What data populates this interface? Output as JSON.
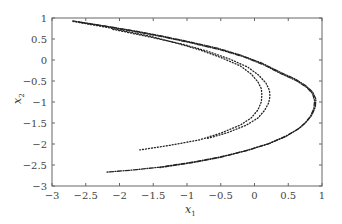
{
  "chart_data": {
    "type": "scatter",
    "title": "",
    "xlabel": "x1",
    "ylabel": "x2",
    "xlim": [
      -3,
      1
    ],
    "ylim": [
      -3,
      1
    ],
    "grid": false,
    "legend": null,
    "xticks": [
      -3,
      -2.5,
      -2,
      -1.5,
      -1,
      -0.5,
      0,
      0.5,
      1
    ],
    "xtick_labels": [
      "−3",
      "−2.5",
      "−2",
      "−1.5",
      "−1",
      "−0.5",
      "0",
      "0.5",
      "1"
    ],
    "yticks": [
      1,
      0.5,
      0,
      -0.5,
      -1,
      -1.5,
      -2,
      -2.5,
      -3
    ],
    "ytick_labels": [
      "1",
      "0.5",
      "0",
      "−0.5",
      "−1",
      "−1.5",
      "−2",
      "−2.5",
      "−3"
    ],
    "series": [
      {
        "name": "outer trajectory A",
        "style": "dash-dot",
        "x": [
          -2.69,
          -2.3,
          -1.84,
          -1.4,
          -0.96,
          -0.55,
          -0.21,
          0.1,
          0.38,
          0.6,
          0.75,
          0.86,
          0.91,
          0.9,
          0.85,
          0.77,
          0.67,
          0.48,
          0.23,
          -0.1,
          -0.51,
          -0.95,
          -1.4,
          -1.8,
          -2.19
        ],
        "y": [
          0.93,
          0.83,
          0.71,
          0.58,
          0.43,
          0.28,
          0.12,
          -0.07,
          -0.29,
          -0.45,
          -0.6,
          -0.76,
          -0.93,
          -1.12,
          -1.31,
          -1.47,
          -1.62,
          -1.8,
          -1.98,
          -2.15,
          -2.31,
          -2.44,
          -2.55,
          -2.62,
          -2.67
        ]
      },
      {
        "name": "outer trajectory B",
        "style": "dash-dot",
        "x": [
          -2.6,
          -2.2,
          -1.78,
          -1.35,
          -0.92,
          -0.5,
          -0.17,
          0.13,
          0.4,
          0.62,
          0.77,
          0.86,
          0.89,
          0.88,
          0.83,
          0.75,
          0.64,
          0.45,
          0.2,
          -0.13,
          -0.54,
          -0.98,
          -1.4
        ],
        "y": [
          0.9,
          0.8,
          0.68,
          0.55,
          0.4,
          0.24,
          0.08,
          -0.11,
          -0.33,
          -0.49,
          -0.65,
          -0.8,
          -0.97,
          -1.15,
          -1.34,
          -1.5,
          -1.65,
          -1.83,
          -2.0,
          -2.16,
          -2.33,
          -2.46,
          -2.56
        ]
      },
      {
        "name": "inner trajectory A",
        "style": "dotted",
        "x": [
          -2.69,
          -2.2,
          -1.55,
          -1.15,
          -0.81,
          -0.5,
          -0.21,
          -0.05,
          0.05,
          0.1,
          0.11,
          0.1,
          0.05,
          -0.05,
          -0.21,
          -0.5,
          -0.81,
          -1.25,
          -1.7
        ],
        "y": [
          0.92,
          0.78,
          0.57,
          0.4,
          0.24,
          0.06,
          -0.14,
          -0.33,
          -0.52,
          -0.68,
          -0.83,
          -1.0,
          -1.19,
          -1.38,
          -1.55,
          -1.74,
          -1.9,
          -2.03,
          -2.14
        ]
      },
      {
        "name": "inner trajectory B",
        "style": "dotted",
        "x": [
          -2.1,
          -1.5,
          -1.05,
          -0.7,
          -0.38,
          -0.1,
          0.06,
          0.17,
          0.22,
          0.23,
          0.21,
          0.15,
          0.05,
          -0.12,
          -0.4,
          -0.7
        ],
        "y": [
          0.73,
          0.53,
          0.37,
          0.21,
          0.03,
          -0.17,
          -0.36,
          -0.55,
          -0.72,
          -0.86,
          -1.02,
          -1.2,
          -1.38,
          -1.55,
          -1.73,
          -1.87
        ]
      }
    ]
  },
  "axes": {
    "xlabel_main": "x",
    "xlabel_sub": "1",
    "ylabel_main": "x",
    "ylabel_sub": "2"
  }
}
